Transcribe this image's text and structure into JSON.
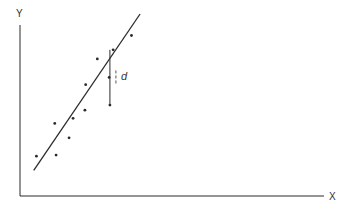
{
  "diagram": {
    "x_axis_label": "X",
    "y_axis_label": "Y",
    "residual_label": "d",
    "colors": {
      "ink": "#2a2a2a",
      "background": "#ffffff"
    }
  },
  "chart_data": {
    "type": "scatter",
    "xlabel": "X",
    "ylabel": "Y",
    "xlim": [
      0,
      100
    ],
    "ylim": [
      0,
      100
    ],
    "ticks": "none",
    "grid": false,
    "points": [
      {
        "x": 8.6,
        "y": 22.8
      },
      {
        "x": 18.9,
        "y": 23.4
      },
      {
        "x": 18.2,
        "y": 41.5
      },
      {
        "x": 25.7,
        "y": 33.3
      },
      {
        "x": 27.8,
        "y": 44.4
      },
      {
        "x": 34.0,
        "y": 49.1
      },
      {
        "x": 34.4,
        "y": 63.7
      },
      {
        "x": 40.5,
        "y": 78.4
      },
      {
        "x": 46.7,
        "y": 67.8
      },
      {
        "x": 48.8,
        "y": 83.6
      },
      {
        "x": 58.4,
        "y": 91.8
      },
      {
        "x": 47.1,
        "y": 52.0
      }
    ],
    "fit_line": {
      "x0": 7.2,
      "y0": 14.6,
      "x1": 62.9,
      "y1": 104.1
    },
    "residual": {
      "x": 47.1,
      "y_point": 52.0,
      "y_line": 83.6,
      "label": "d"
    }
  }
}
